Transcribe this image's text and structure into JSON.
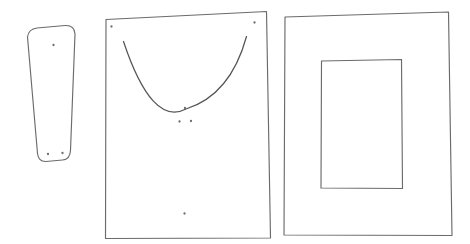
{
  "scene": {
    "title": "Pattern pieces line drawing",
    "background_color": "#ffffff",
    "stroke_color": "#6b6b6b",
    "curve_color": "#555555",
    "dot_color": "#6e6e6e",
    "width": 470,
    "height": 244
  },
  "shapes": [
    {
      "id": "tapered-piece",
      "name": "rounded tapered trapezoid piece",
      "kind": "closed-path",
      "path": "M 27.5 37 Q 28.5 29 37 28 L 65 25.5 Q 74.5 25 75 34 L 70.5 150 Q 70.2 159.5 62.5 160 L 46 161.5 Q 38.5 161.8 37.5 153.5 Z",
      "dots": [
        {
          "name": "dot-top-center",
          "cx": 53.5,
          "cy": 45.0,
          "r": 1.15
        },
        {
          "name": "dot-bottom-left",
          "cx": 48.0,
          "cy": 154.0,
          "r": 1.15
        },
        {
          "name": "dot-bottom-right",
          "cx": 62.5,
          "cy": 153.0,
          "r": 1.15
        }
      ]
    },
    {
      "id": "front-panel",
      "name": "front panel with neckline curve",
      "kind": "closed-path",
      "path": "M 106.0 19.5 L 266.5 11.5 L 270.5 238.0 L 105.5 238.5 Z",
      "curve": {
        "name": "neckline-curve",
        "path": "M 123.5 41.5 Q 152.0 127.0 186.0 109.0 Q 230.5 95.0 246.5 36.5"
      },
      "dots": [
        {
          "name": "dot-top-left-corner",
          "cx": 111.5,
          "cy": 26.5,
          "r": 1.15
        },
        {
          "name": "dot-top-right-corner",
          "cx": 254.5,
          "cy": 22.5,
          "r": 1.15
        },
        {
          "name": "dot-curve-center",
          "cx": 185.0,
          "cy": 108.0,
          "r": 1.15
        },
        {
          "name": "dot-below-curve-left",
          "cx": 179.5,
          "cy": 121.5,
          "r": 1.15
        },
        {
          "name": "dot-below-curve-right",
          "cx": 191.0,
          "cy": 121.0,
          "r": 1.15
        },
        {
          "name": "dot-lower-center",
          "cx": 184.5,
          "cy": 213.5,
          "r": 1.15
        }
      ]
    },
    {
      "id": "back-panel",
      "name": "back panel with inner opening rectangle",
      "kind": "closed-path",
      "path": "M 285.0 17.0 L 448.5 12.0 L 452.0 235.5 L 284.0 235.0 Z",
      "inner_rect": {
        "name": "inner-opening",
        "path": "M 321.5 61.0 L 401.5 59.5 L 402.5 188.5 L 321.0 188.0 Z"
      },
      "dots": []
    }
  ]
}
